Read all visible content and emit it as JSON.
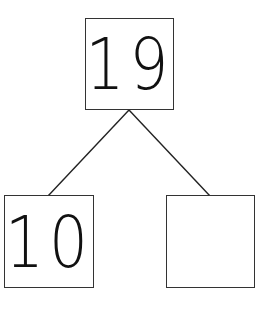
{
  "diagram": {
    "type": "number-bond",
    "whole": {
      "value": "19"
    },
    "parts": [
      {
        "value": "10"
      },
      {
        "value": ""
      }
    ]
  }
}
